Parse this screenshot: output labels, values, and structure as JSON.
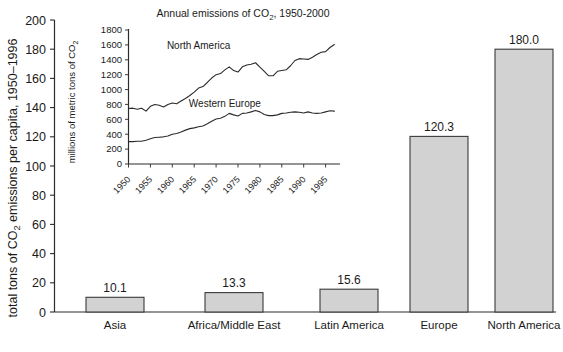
{
  "chart_data": [
    {
      "id": "main",
      "type": "bar",
      "title": "",
      "xlabel": "",
      "ylabel": "total tons of CO2 emissions per capita, 1950-1996",
      "ylabel_parts": {
        "before": "total tons of CO",
        "sub": "2",
        "after": " emissions per capita, 1950–1996"
      },
      "categories": [
        "Asia",
        "Africa/Middle East",
        "Latin America",
        "Europe",
        "North America"
      ],
      "values": [
        10.1,
        13.3,
        15.6,
        120.3,
        180.0
      ],
      "value_labels": [
        "10.1",
        "13.3",
        "15.6",
        "120.3",
        "180.0"
      ],
      "ylim": [
        0,
        200
      ],
      "yticks": [
        0,
        20,
        40,
        60,
        80,
        100,
        120,
        140,
        160,
        180,
        200
      ],
      "ytick_labels": [
        "0",
        "20",
        "40",
        "60",
        "80",
        "100",
        "120",
        "140",
        "160",
        "180",
        "200"
      ],
      "grid": false,
      "legend": "none",
      "bar_fill": "#d2d2d2",
      "bar_stroke": "#3a3a3a"
    },
    {
      "id": "inset",
      "type": "line",
      "title": "Annual emissions of CO2, 1950-2000",
      "title_parts": {
        "before": "Annual emissions of CO",
        "sub": "2",
        "after": ", 1950-2000"
      },
      "xlabel": "",
      "ylabel": "millions of metric tons of CO2",
      "ylabel_parts": {
        "before": "millions of metric tons of CO",
        "sub": "2",
        "after": ""
      },
      "ylim": [
        0,
        1800
      ],
      "yticks": [
        0,
        200,
        400,
        600,
        800,
        1000,
        1200,
        1400,
        1600,
        1800
      ],
      "ytick_labels": [
        "0",
        "200",
        "400",
        "600",
        "800",
        "1000",
        "1200",
        "1400",
        "1600",
        "1800"
      ],
      "xlim": [
        1950,
        1998
      ],
      "xticks": [
        1950,
        1955,
        1960,
        1965,
        1970,
        1975,
        1980,
        1985,
        1990,
        1995
      ],
      "xtick_labels": [
        "1950",
        "1955",
        "1960",
        "1965",
        "1970",
        "1975",
        "1980",
        "1985",
        "1990",
        "1995"
      ],
      "grid": false,
      "legend": "inline-labels",
      "x": [
        1950,
        1951,
        1952,
        1953,
        1954,
        1955,
        1956,
        1957,
        1958,
        1959,
        1960,
        1961,
        1962,
        1963,
        1964,
        1965,
        1966,
        1967,
        1968,
        1969,
        1970,
        1971,
        1972,
        1973,
        1974,
        1975,
        1976,
        1977,
        1978,
        1979,
        1980,
        1981,
        1982,
        1983,
        1984,
        1985,
        1986,
        1987,
        1988,
        1989,
        1990,
        1991,
        1992,
        1993,
        1994,
        1995,
        1996,
        1997
      ],
      "series": [
        {
          "name": "North America",
          "label_x": 1966,
          "label_y": 1540,
          "values": [
            745,
            750,
            735,
            750,
            710,
            775,
            800,
            790,
            765,
            800,
            820,
            810,
            845,
            880,
            920,
            965,
            1020,
            1040,
            1095,
            1155,
            1200,
            1215,
            1265,
            1305,
            1255,
            1235,
            1305,
            1330,
            1340,
            1360,
            1300,
            1245,
            1185,
            1185,
            1245,
            1255,
            1265,
            1320,
            1390,
            1415,
            1410,
            1405,
            1435,
            1470,
            1500,
            1510,
            1565,
            1605
          ]
        },
        {
          "name": "Western Europe",
          "label_x": 1972,
          "label_y": 760,
          "values": [
            300,
            300,
            305,
            305,
            320,
            340,
            355,
            360,
            365,
            375,
            400,
            410,
            430,
            455,
            475,
            485,
            500,
            510,
            540,
            575,
            605,
            615,
            640,
            680,
            660,
            645,
            680,
            685,
            700,
            720,
            700,
            665,
            650,
            650,
            660,
            680,
            685,
            695,
            700,
            695,
            685,
            700,
            685,
            680,
            685,
            700,
            715,
            710
          ]
        }
      ]
    }
  ]
}
